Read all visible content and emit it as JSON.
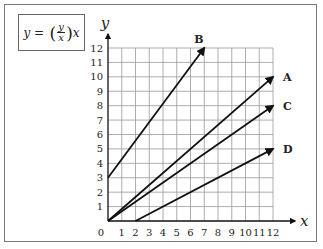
{
  "equation": {
    "lhs": "y =",
    "num": "y",
    "den": "x",
    "rhs": "x"
  },
  "chart_data": {
    "type": "line",
    "title": "",
    "xlabel": "x",
    "ylabel": "y",
    "xlim": [
      0,
      12
    ],
    "ylim": [
      0,
      12
    ],
    "grid": true,
    "x_ticks": [
      "0",
      "1",
      "2",
      "3",
      "4",
      "5",
      "6",
      "7",
      "8",
      "9",
      "10",
      "11",
      "12"
    ],
    "y_ticks": [
      "1",
      "2",
      "3",
      "4",
      "5",
      "6",
      "7",
      "8",
      "9",
      "10",
      "11",
      "12"
    ],
    "series": [
      {
        "name": "B",
        "points": [
          [
            0,
            3
          ],
          [
            7,
            12
          ]
        ],
        "arrow": true
      },
      {
        "name": "A",
        "points": [
          [
            0,
            0
          ],
          [
            12,
            10
          ]
        ],
        "arrow": true
      },
      {
        "name": "C",
        "points": [
          [
            0,
            0
          ],
          [
            12,
            8
          ]
        ],
        "arrow": true
      },
      {
        "name": "D",
        "points": [
          [
            2,
            0
          ],
          [
            12,
            5
          ]
        ],
        "arrow": true
      }
    ]
  }
}
